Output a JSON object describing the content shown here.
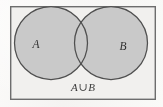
{
  "figure": {
    "kind": "venn-diagram",
    "caption": "A∪B"
  },
  "universal_set": {
    "name": "rectangle-border",
    "x": 10,
    "y": 6,
    "width": 146,
    "height": 94,
    "stroke_color": "#6d6d6d",
    "fill_color": "#f1f0ee",
    "stroke_width": 1.4
  },
  "sets": [
    {
      "id": "A",
      "label": "A",
      "center_x": 51,
      "center_y": 43,
      "radius": 36,
      "label_x": 36,
      "label_y": 48,
      "fill_color": "#c9c9c9",
      "stroke_color": "#4f4f4f"
    },
    {
      "id": "B",
      "label": "B",
      "center_x": 111,
      "center_y": 43,
      "radius": 36,
      "label_x": 122,
      "label_y": 50,
      "fill_color": "#c9c9c9",
      "stroke_color": "#4f4f4f"
    }
  ],
  "caption": {
    "text": "A∪B",
    "parts": {
      "left_set": "A",
      "operator": "∪",
      "right_set": "B"
    },
    "x": 83,
    "y": 90,
    "font_size": 11,
    "color": "#3a3a3a"
  },
  "colors": {
    "page_background": "#fdfdfc",
    "shaded_region": "#c9c9c9",
    "unshaded_region": "#f1f0ee",
    "outline": "#4f4f4f",
    "frame": "#6d6d6d",
    "text": "#3a3a3a"
  }
}
